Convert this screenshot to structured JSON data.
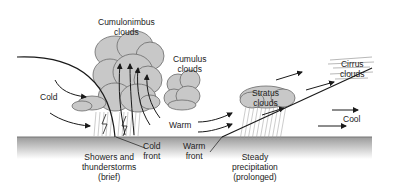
{
  "diagram": {
    "labels": {
      "cumulonimbus": [
        "Cumulonimbus",
        "clouds"
      ],
      "cumulus": [
        "Cumulus",
        "clouds"
      ],
      "stratus": [
        "Stratus",
        "clouds"
      ],
      "cirrus": [
        "Cirrus",
        "clouds"
      ],
      "cold": "Cold",
      "warm": "Warm",
      "cool": "Cool",
      "cold_front": [
        "Cold",
        "front"
      ],
      "warm_front": [
        "Warm",
        "front"
      ],
      "showers": [
        "Showers and",
        "thunderstorms",
        "(brief)"
      ],
      "steady": [
        "Steady",
        "precipitation",
        "(prolonged)"
      ]
    },
    "colors": {
      "cloud_fill": "#c8c8c8",
      "cloud_stroke": "#6a6a6a",
      "ground_top": "#9a9a9a",
      "ground_bottom": "#ffffff",
      "line": "#1a1a1a"
    }
  }
}
